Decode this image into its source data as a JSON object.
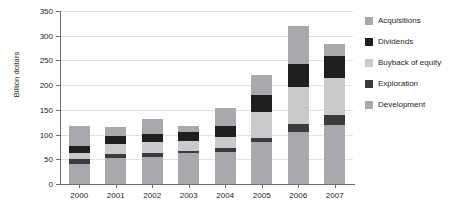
{
  "chart_data": {
    "type": "bar",
    "subtype": "stacked-bar",
    "title": "",
    "xlabel": "",
    "ylabel": "Billion dollars",
    "ylim": [
      0,
      350
    ],
    "yticks": [
      0,
      50,
      100,
      150,
      200,
      250,
      300,
      350
    ],
    "grid": true,
    "legend_position": "right",
    "categories": [
      "2000",
      "2001",
      "2002",
      "2003",
      "2004",
      "2005",
      "2006",
      "2007"
    ],
    "series": [
      {
        "name": "Development",
        "color": "#a7a9ac",
        "values": [
          40,
          53,
          55,
          62,
          65,
          85,
          105,
          120
        ]
      },
      {
        "name": "Exploration",
        "color": "#3b3b3d",
        "values": [
          10,
          7,
          8,
          5,
          8,
          8,
          17,
          20
        ]
      },
      {
        "name": "Buyback of equity",
        "color": "#c9cacc",
        "values": [
          12,
          20,
          22,
          20,
          22,
          52,
          75,
          75
        ]
      },
      {
        "name": "Dividends",
        "color": "#201f1f",
        "values": [
          15,
          18,
          16,
          18,
          23,
          35,
          45,
          45
        ]
      },
      {
        "name": "Acquisitions",
        "color": "#a7a9ac",
        "values": [
          41,
          17,
          30,
          12,
          35,
          40,
          78,
          23
        ]
      }
    ],
    "totals": [
      118,
      115,
      131,
      117,
      153,
      220,
      320,
      283
    ],
    "legend_order": [
      "Acquisitions",
      "Dividends",
      "Buyback of equity",
      "Exploration",
      "Development"
    ],
    "colors": {
      "acquisitions": "#a7a9ac",
      "dividends": "#201f1f",
      "buyback_of_equity": "#c9cacc",
      "exploration": "#3b3b3d",
      "development": "#a7a9ac",
      "axis": "#6d6e70",
      "grid": "#e3e1df",
      "text": "#231f20",
      "background": "#ffffff"
    }
  }
}
